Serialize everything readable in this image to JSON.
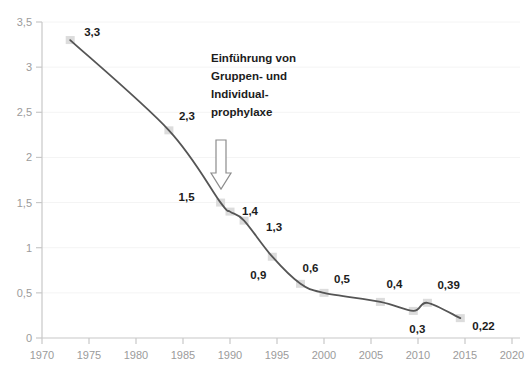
{
  "chart_data": {
    "type": "line",
    "title": "",
    "subtitle": "",
    "xlabel": "",
    "ylabel": "",
    "xlim": [
      1970,
      2020
    ],
    "ylim": [
      0,
      3.5
    ],
    "grid": true,
    "legend": null,
    "decimal_separator": ",",
    "x_ticks": [
      "1970",
      "1975",
      "1980",
      "1985",
      "1990",
      "1995",
      "2000",
      "2005",
      "2010",
      "2015",
      "2020"
    ],
    "x_tick_values": [
      1970,
      1975,
      1980,
      1985,
      1990,
      1995,
      2000,
      2005,
      2010,
      2015,
      2020
    ],
    "y_ticks": [
      "0",
      "0,5",
      "1",
      "1,5",
      "2",
      "2,5",
      "3",
      "3,5"
    ],
    "y_tick_values": [
      0,
      0.5,
      1,
      1.5,
      2,
      2.5,
      3,
      3.5
    ],
    "series": [
      {
        "name": "DMFT",
        "x": [
          1973,
          1983.5,
          1989,
          1990,
          1991.5,
          1994.5,
          1997.5,
          2000,
          2006,
          2009.5,
          2011,
          2014.5
        ],
        "values": [
          3.3,
          2.3,
          1.5,
          1.4,
          1.3,
          0.9,
          0.6,
          0.5,
          0.4,
          0.3,
          0.39,
          0.22
        ],
        "labels": [
          "3,3",
          "2,3",
          "1,5",
          "1,4",
          "1,3",
          "0,9",
          "0,6",
          "0,5",
          "0,4",
          "0,3",
          "0,39",
          "0,22"
        ]
      }
    ],
    "annotations": [
      {
        "name": "prophylaxe-note",
        "lines": [
          "Einführung von",
          "Gruppen- und",
          "Individual-",
          "prophylaxe"
        ],
        "arrow": "down-arrow",
        "arrow_target_year": 1990
      }
    ],
    "colors": {
      "line": "#555555",
      "marker": "#dcdcdc",
      "axis": "#c8c8c8",
      "tick_text": "#9b9b9b",
      "label_text": "#1c1c1c",
      "grid": "#f4f4f4",
      "background": "#ffffff",
      "arrow_stroke": "#8c8c8c",
      "arrow_fill": "#ffffff"
    }
  }
}
